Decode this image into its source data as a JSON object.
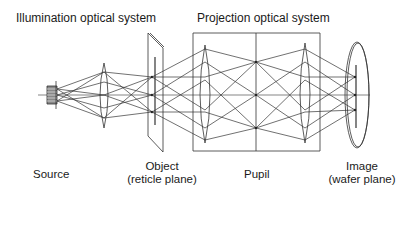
{
  "diagram": {
    "title_illumination": "Illumination optical system",
    "title_projection": "Projection optical system",
    "labels": {
      "source": "Source",
      "object_line1": "Object",
      "object_line2": "(reticle plane)",
      "pupil": "Pupil",
      "image_line1": "Image",
      "image_line2": "(wafer plane)"
    },
    "colors": {
      "stroke": "#333333",
      "background": "#ffffff",
      "text": "#1a1a1a"
    },
    "components": [
      {
        "name": "source",
        "type": "lamp"
      },
      {
        "name": "illumination-lens",
        "type": "biconvex-lens"
      },
      {
        "name": "reticle",
        "type": "plate"
      },
      {
        "name": "projection-lens-1",
        "type": "biconvex-lens"
      },
      {
        "name": "pupil-plane",
        "type": "aperture-stop"
      },
      {
        "name": "projection-lens-2",
        "type": "biconvex-lens"
      },
      {
        "name": "wafer",
        "type": "image-plane"
      }
    ]
  }
}
